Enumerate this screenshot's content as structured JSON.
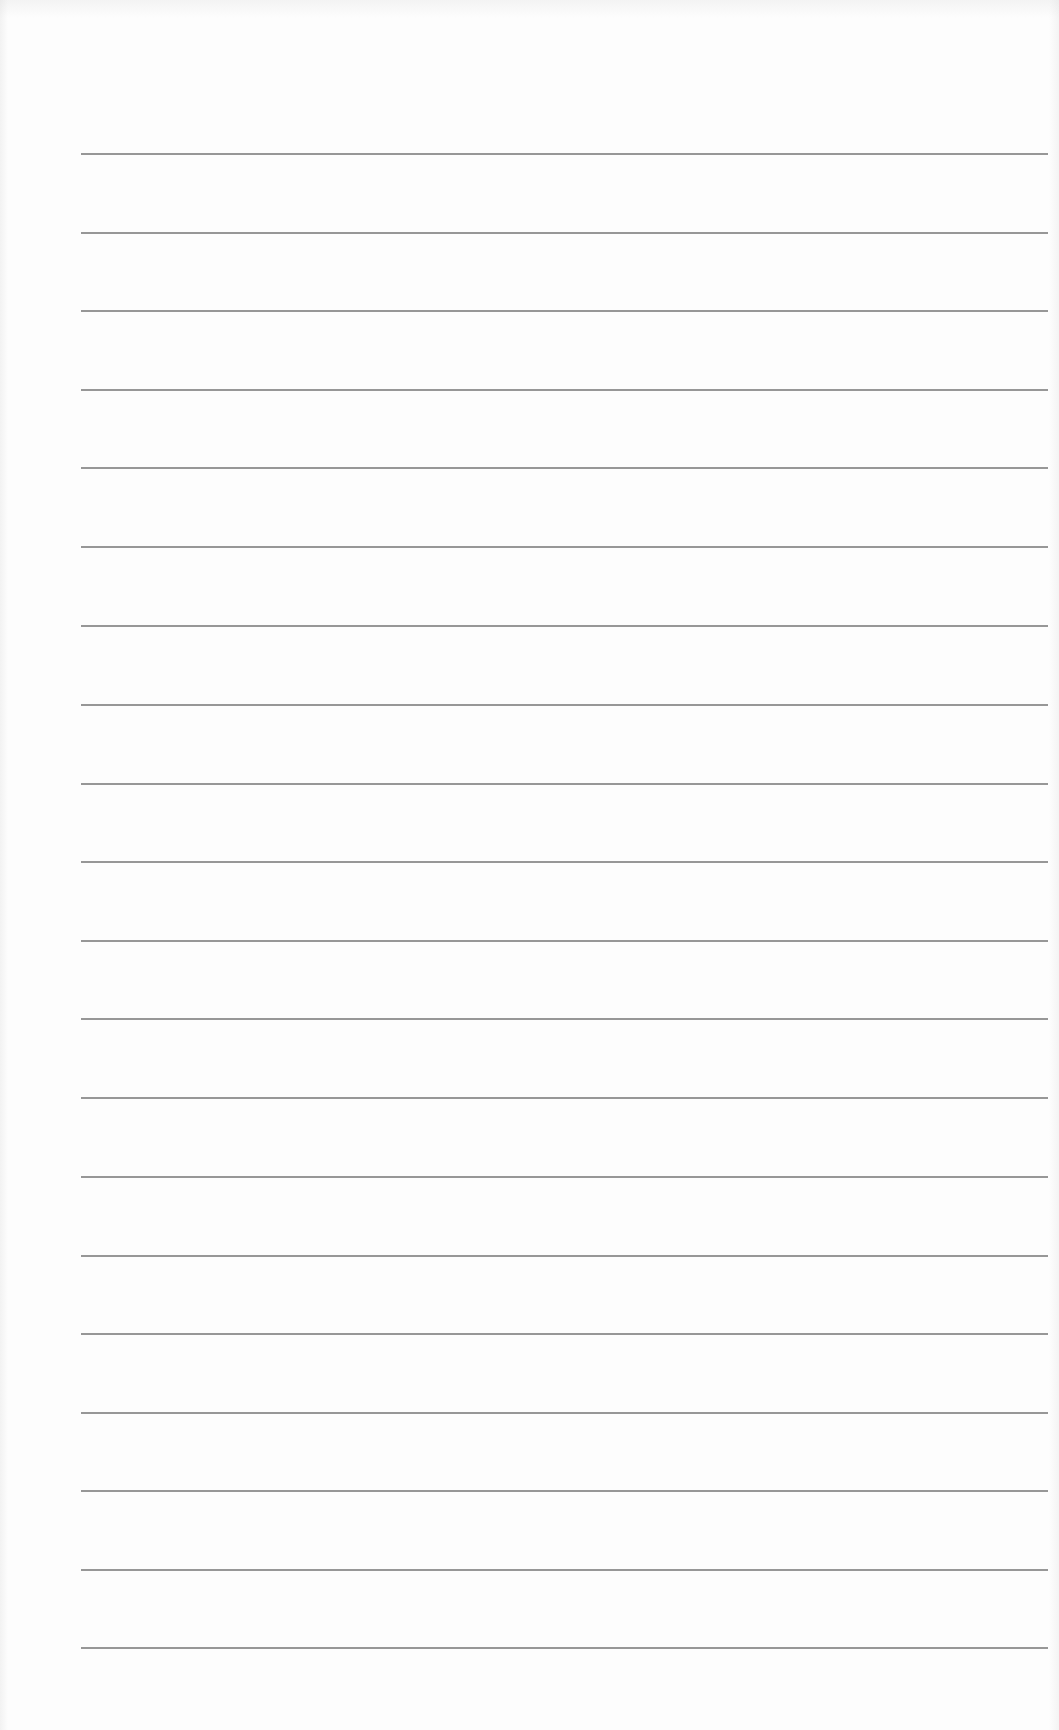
{
  "document": {
    "type": "blank lined page",
    "line_count": 20,
    "line_color": "#8c8c8c",
    "background_color": "#fdfdfd",
    "lines": [
      {
        "index": 1,
        "text": ""
      },
      {
        "index": 2,
        "text": ""
      },
      {
        "index": 3,
        "text": ""
      },
      {
        "index": 4,
        "text": ""
      },
      {
        "index": 5,
        "text": ""
      },
      {
        "index": 6,
        "text": ""
      },
      {
        "index": 7,
        "text": ""
      },
      {
        "index": 8,
        "text": ""
      },
      {
        "index": 9,
        "text": ""
      },
      {
        "index": 10,
        "text": ""
      },
      {
        "index": 11,
        "text": ""
      },
      {
        "index": 12,
        "text": ""
      },
      {
        "index": 13,
        "text": ""
      },
      {
        "index": 14,
        "text": ""
      },
      {
        "index": 15,
        "text": ""
      },
      {
        "index": 16,
        "text": ""
      },
      {
        "index": 17,
        "text": ""
      },
      {
        "index": 18,
        "text": ""
      },
      {
        "index": 19,
        "text": ""
      },
      {
        "index": 20,
        "text": ""
      }
    ]
  }
}
